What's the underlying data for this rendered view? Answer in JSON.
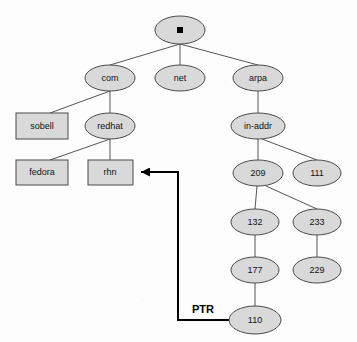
{
  "diagram": {
    "type": "tree-diagram",
    "background_color": "#fdfdfd",
    "node_fill_color": "#d9d9d9",
    "node_stroke_color": "#4a4a4a",
    "edge_color": "#555555",
    "ptr_edge_color": "#000000",
    "nodes": [
      {
        "id": "root",
        "label": ".",
        "shape": "ellipse",
        "cx": 180,
        "cy": 30,
        "rx": 25,
        "ry": 14,
        "label_kind": "dot-square"
      },
      {
        "id": "com",
        "label": "com",
        "shape": "ellipse",
        "cx": 110,
        "cy": 78,
        "rx": 25,
        "ry": 13,
        "label_kind": "text"
      },
      {
        "id": "net",
        "label": "net",
        "shape": "ellipse",
        "cx": 180,
        "cy": 78,
        "rx": 25,
        "ry": 13,
        "label_kind": "text"
      },
      {
        "id": "arpa",
        "label": "arpa",
        "shape": "ellipse",
        "cx": 258,
        "cy": 78,
        "rx": 25,
        "ry": 13,
        "label_kind": "text"
      },
      {
        "id": "sobell",
        "label": "sobell",
        "shape": "rect",
        "x": 16,
        "y": 113,
        "w": 52,
        "h": 26,
        "label_kind": "text"
      },
      {
        "id": "redhat",
        "label": "redhat",
        "shape": "ellipse",
        "cx": 110,
        "cy": 126,
        "rx": 25,
        "ry": 13,
        "label_kind": "text"
      },
      {
        "id": "in-addr",
        "label": "in-addr",
        "shape": "ellipse",
        "cx": 258,
        "cy": 126,
        "rx": 27,
        "ry": 13,
        "label_kind": "text"
      },
      {
        "id": "fedora",
        "label": "fedora",
        "shape": "rect",
        "x": 16,
        "y": 160,
        "w": 52,
        "h": 25,
        "label_kind": "text"
      },
      {
        "id": "rhn",
        "label": "rhn",
        "shape": "rect",
        "x": 88,
        "y": 160,
        "w": 45,
        "h": 25,
        "label_kind": "text"
      },
      {
        "id": "209",
        "label": "209",
        "shape": "ellipse",
        "cx": 258,
        "cy": 173,
        "rx": 25,
        "ry": 13,
        "label_kind": "text"
      },
      {
        "id": "111",
        "label": "111",
        "shape": "ellipse",
        "cx": 317,
        "cy": 173,
        "rx": 24,
        "ry": 13,
        "label_kind": "text"
      },
      {
        "id": "132",
        "label": "132",
        "shape": "ellipse",
        "cx": 255,
        "cy": 222,
        "rx": 24,
        "ry": 13,
        "label_kind": "text"
      },
      {
        "id": "233",
        "label": "233",
        "shape": "ellipse",
        "cx": 317,
        "cy": 222,
        "rx": 24,
        "ry": 13,
        "label_kind": "text"
      },
      {
        "id": "177",
        "label": "177",
        "shape": "ellipse",
        "cx": 255,
        "cy": 270,
        "rx": 24,
        "ry": 13,
        "label_kind": "text"
      },
      {
        "id": "229",
        "label": "229",
        "shape": "ellipse",
        "cx": 317,
        "cy": 270,
        "rx": 24,
        "ry": 13,
        "label_kind": "text"
      },
      {
        "id": "110",
        "label": "110",
        "shape": "ellipse",
        "cx": 255,
        "cy": 320,
        "rx": 26,
        "ry": 14,
        "label_kind": "text"
      }
    ],
    "edges": [
      {
        "from": "root",
        "to": "com",
        "points": "180,44 110,65"
      },
      {
        "from": "root",
        "to": "net",
        "points": "180,44 180,65"
      },
      {
        "from": "root",
        "to": "arpa",
        "points": "180,44 258,65"
      },
      {
        "from": "com",
        "to": "sobell",
        "points": "110,91 50,113"
      },
      {
        "from": "com",
        "to": "redhat",
        "points": "110,91 110,113"
      },
      {
        "from": "redhat",
        "to": "fedora",
        "points": "110,139 50,160"
      },
      {
        "from": "redhat",
        "to": "rhn",
        "points": "110,139 110,160"
      },
      {
        "from": "arpa",
        "to": "in-addr",
        "points": "258,91 258,113"
      },
      {
        "from": "in-addr",
        "to": "209",
        "points": "258,139 258,160"
      },
      {
        "from": "in-addr",
        "to": "111",
        "points": "262,139 317,160"
      },
      {
        "from": "209",
        "to": "132",
        "points": "257,186 255,209"
      },
      {
        "from": "209",
        "to": "233",
        "points": "266,186 317,209"
      },
      {
        "from": "132",
        "to": "177",
        "points": "255,235 255,257"
      },
      {
        "from": "233",
        "to": "229",
        "points": "317,235 317,257"
      },
      {
        "from": "177",
        "to": "110",
        "points": "255,283 255,306"
      }
    ],
    "ptr_record": {
      "label": "PTR",
      "label_x": 203,
      "label_y": 310,
      "from_node": "110",
      "to_node": "rhn",
      "path": "229,320 178,320 178,172 141,172",
      "arrow_tip_x": 133,
      "arrow_tip_y": 172
    }
  }
}
